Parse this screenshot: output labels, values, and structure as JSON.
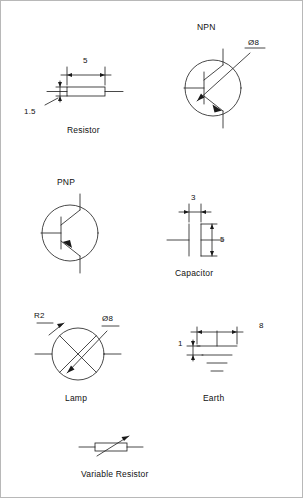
{
  "sheet": {
    "title": "electronic-symbols-dimension-sheet",
    "background": "#ffffff",
    "stroke": "#1a1a1a",
    "width": 303,
    "height": 498
  },
  "symbols": {
    "resistor": {
      "caption": "Resistor",
      "dim_length": "5",
      "dim_height": "1.5"
    },
    "npn": {
      "caption": "NPN",
      "dim_diameter": "Ø8"
    },
    "pnp": {
      "caption": "PNP"
    },
    "capacitor": {
      "caption": "Capacitor",
      "dim_gap": "3",
      "dim_plate": "5"
    },
    "lamp": {
      "caption": "Lamp",
      "dim_radius": "R2",
      "dim_diameter": "Ø8"
    },
    "earth": {
      "caption": "Earth",
      "dim_width": "8",
      "dim_spacing": "1"
    },
    "variable_resistor": {
      "caption": "Variable Resistor"
    }
  }
}
